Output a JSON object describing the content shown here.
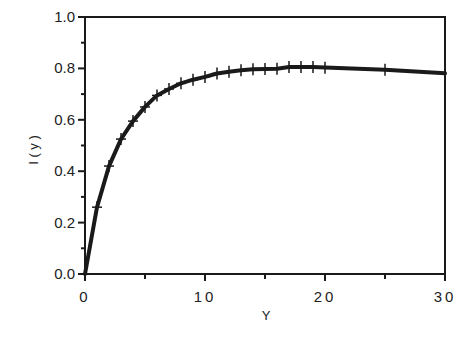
{
  "chart_data": {
    "type": "line",
    "title": "",
    "xlabel": "Y",
    "ylabel": "I ( y )",
    "xlim": [
      0,
      30
    ],
    "ylim": [
      0,
      1.0
    ],
    "grid": false,
    "legend": null,
    "x_ticks": [
      0,
      10,
      20,
      30
    ],
    "x_tick_labels": [
      "0",
      "10",
      "20",
      "30"
    ],
    "x_minor_ticks": [
      5,
      15,
      25
    ],
    "y_ticks": [
      0.0,
      0.2,
      0.4,
      0.6,
      0.8,
      1.0
    ],
    "y_tick_labels": [
      "0.0",
      "0.2",
      "0.4",
      "0.6",
      "0.8",
      "1.0"
    ],
    "y_minor_ticks": [
      0.1,
      0.3,
      0.5,
      0.7,
      0.9
    ],
    "series": [
      {
        "name": "I(y)",
        "line_color": "#1a1a1a",
        "marker": "+",
        "x": [
          0,
          1,
          2,
          3,
          4,
          5,
          6,
          7,
          8,
          9,
          10,
          11,
          12,
          13,
          14,
          15,
          16,
          17,
          18,
          19,
          20,
          25,
          30
        ],
        "values": [
          0.0,
          0.26,
          0.42,
          0.525,
          0.595,
          0.65,
          0.695,
          0.72,
          0.742,
          0.756,
          0.767,
          0.78,
          0.787,
          0.793,
          0.797,
          0.798,
          0.799,
          0.805,
          0.805,
          0.805,
          0.803,
          0.795,
          0.781
        ],
        "marker_x": [
          1,
          2,
          3,
          4,
          5,
          6,
          7,
          8,
          9,
          10,
          11,
          12,
          13,
          14,
          15,
          16,
          17,
          18,
          19,
          20,
          25
        ]
      }
    ]
  }
}
